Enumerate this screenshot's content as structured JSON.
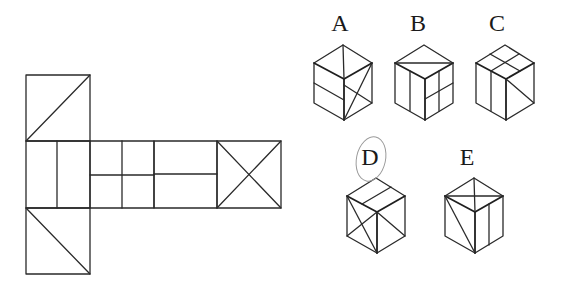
{
  "diagram": {
    "type": "cube-net-folding-puzzle",
    "net": {
      "description": "Cross-shaped cube net with six faces",
      "faces": [
        {
          "id": "top",
          "pattern": "diagonal from bottom-left to top-right"
        },
        {
          "id": "left-middle",
          "pattern": "one vertical line dividing the face"
        },
        {
          "id": "center",
          "pattern": "2x2 grid (one vertical and one horizontal line)"
        },
        {
          "id": "right-middle",
          "pattern": "one horizontal line dividing the face"
        },
        {
          "id": "far-right",
          "pattern": "X (both diagonals)"
        },
        {
          "id": "bottom",
          "pattern": "diagonal from top-left to bottom-right"
        }
      ]
    },
    "options": [
      {
        "label": "A",
        "selected": false
      },
      {
        "label": "B",
        "selected": false
      },
      {
        "label": "C",
        "selected": false
      },
      {
        "label": "D",
        "selected": true
      },
      {
        "label": "E",
        "selected": false
      }
    ],
    "selected_answer": "D",
    "colors": {
      "line": "#2a2a2a",
      "circle": "#9a9a9a",
      "background": "#ffffff"
    }
  }
}
